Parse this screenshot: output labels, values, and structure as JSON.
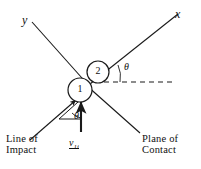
{
  "figure": {
    "stroke_color": "#1a1a1a",
    "background": "#ffffff"
  },
  "axes": {
    "x_label": "x",
    "y_label": "y",
    "x_line": {
      "x1": 94,
      "y1": 78,
      "x2": 178,
      "y2": 14
    },
    "y_line": {
      "x1": 88,
      "y1": 84,
      "x2": 32,
      "y2": 22
    }
  },
  "bodies": [
    {
      "name": "particle-1",
      "label": "1",
      "cx": 80,
      "cy": 90,
      "r": 12
    },
    {
      "name": "particle-2",
      "label": "2",
      "cx": 98,
      "cy": 72,
      "r": 11
    }
  ],
  "angles": [
    {
      "name": "theta-axis",
      "label": "θ",
      "x": 124,
      "y": 62
    },
    {
      "name": "theta-velocity",
      "label": "θ",
      "x": 76,
      "y": 116
    }
  ],
  "velocity": {
    "symbol": "v",
    "subscript": "1i",
    "arrow": {
      "x1": 81,
      "y1": 133,
      "x2": 81,
      "y2": 103
    }
  },
  "construction": {
    "dashed_reference": {
      "x1": 105,
      "y1": 82,
      "x2": 172,
      "y2": 82
    },
    "impact_arrow": {
      "x1": 32,
      "y1": 139,
      "x2": 78,
      "y2": 100
    },
    "contact_line": {
      "x1": 85,
      "y1": 86,
      "x2": 140,
      "y2": 140
    },
    "angle_base": {
      "x1": 58,
      "y1": 120,
      "x2": 81,
      "y2": 120
    }
  },
  "captions": [
    {
      "name": "line-of-impact",
      "line1": "Line of",
      "line2": "Impact",
      "x": 6,
      "y": 137
    },
    {
      "name": "plane-of-contact",
      "line1": "Plane of",
      "line2": "Contact",
      "x": 143,
      "y": 137
    }
  ]
}
